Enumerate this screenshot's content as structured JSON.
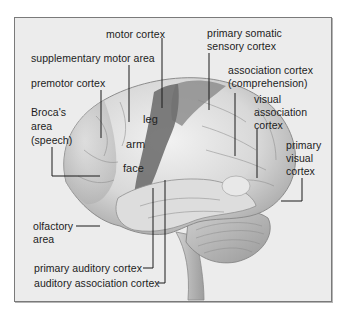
{
  "figure": {
    "colors": {
      "frame_bg": "#ececec",
      "frame_border": "#7a7a7a",
      "brain_light": "#e2e2e2",
      "brain_mid": "#c4c4c4",
      "motor_strip": "#7d7d7d",
      "somatosensory_strip": "#a0a0a0",
      "cerebellum": "#b9b9b9",
      "leader_line": "#1a1a1a"
    }
  },
  "labels": {
    "motor_cortex": "motor cortex",
    "supplementary_motor_area": "supplementary motor area",
    "premotor_cortex": "premotor cortex",
    "broca_line1": "Broca's",
    "broca_line2": "area",
    "broca_line3": "(speech)",
    "leg": "leg",
    "arm": "arm",
    "face": "face",
    "primary_somatic_line1": "primary somatic",
    "primary_somatic_line2": "sensory cortex",
    "association_line1": "association cortex",
    "association_line2": "(comprehension)",
    "visual_assoc_line1": "visual",
    "visual_assoc_line2": "association",
    "visual_assoc_line3": "cortex",
    "primary_visual_line1": "primary",
    "primary_visual_line2": "visual",
    "primary_visual_line3": "cortex",
    "olfactory_line1": "olfactory",
    "olfactory_line2": "area",
    "primary_auditory": "primary auditory cortex",
    "auditory_association": "auditory association cortex"
  }
}
